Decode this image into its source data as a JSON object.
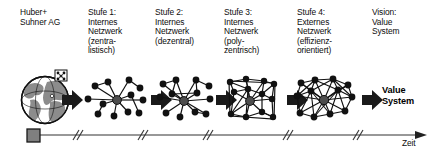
{
  "diagram": {
    "title_columns": [
      {
        "id": "company",
        "label": "Huber+\nSuhner AG",
        "x": 20,
        "y": 8
      },
      {
        "id": "stage-1",
        "label": "Stufe 1:\nInternes\nNetzwerk\n(zentra-\nlistisch)",
        "x": 88,
        "y": 8
      },
      {
        "id": "stage-2",
        "label": "Stufe 2:\nInternes\nNetzwerk\n(dezentral)",
        "x": 155,
        "y": 8
      },
      {
        "id": "stage-3",
        "label": "Stufe 3:\nInternes\nNetzwerk\n(poly-\nzentrisch)",
        "x": 224,
        "y": 8
      },
      {
        "id": "stage-4",
        "label": "Stufe 4:\nExternes\nNetzwerk\n(effizienz-\norientiert)",
        "x": 297,
        "y": 8
      },
      {
        "id": "vision",
        "label": "Vision:\nValue\nSystem",
        "x": 372,
        "y": 8
      }
    ],
    "result_label": {
      "text": "Value\nSystem",
      "x": 382,
      "y": 85
    },
    "axis": {
      "label": "Zeit",
      "label_x": 402,
      "label_y": 139,
      "line_y": 135,
      "line_start_x": 30,
      "line_end_x": 428,
      "break_marks_x": [
        75,
        140,
        205,
        285,
        355
      ]
    },
    "icon_names": {
      "globe": "globe-icon",
      "start_marker": "timeline-start-square-icon",
      "arrow": "block-arrow-icon",
      "network": "network-graph-icon",
      "axis_arrow": "axis-arrowhead-icon",
      "break": "axis-break-icon"
    },
    "colors": {
      "ink": "#0d0d0d",
      "node": "#111111",
      "hub": "#4d4d4d",
      "globe_land": "#8c8c8c",
      "arrow": "#1a1a1a",
      "axis": "#333333",
      "marker": "#808080",
      "background": "#ffffff"
    },
    "stages": [
      {
        "id": "stage-1-network",
        "kind": "star-tree",
        "caption_ref": "stage-1",
        "cx": 117,
        "cy": 100,
        "hub": [
          117,
          100
        ],
        "nodes": [
          [
            95,
            86
          ],
          [
            108,
            82
          ],
          [
            129,
            80
          ],
          [
            140,
            88
          ],
          [
            88,
            99
          ],
          [
            103,
            104
          ],
          [
            131,
            95
          ],
          [
            143,
            100
          ],
          [
            98,
            114
          ],
          [
            114,
            116
          ],
          [
            128,
            112
          ],
          [
            139,
            113
          ]
        ],
        "edges": [
          [
            0,
            1
          ],
          [
            1,
            2
          ],
          [
            2,
            3
          ],
          [
            4,
            5
          ],
          [
            6,
            7
          ],
          [
            8,
            9
          ],
          [
            10,
            11
          ]
        ],
        "hub_links": [
          0,
          1,
          2,
          4,
          5,
          6,
          7,
          9,
          10
        ]
      },
      {
        "id": "stage-2-network",
        "kind": "decentral-star",
        "caption_ref": "stage-2",
        "cx": 186,
        "cy": 100,
        "hub": [
          184,
          101
        ],
        "nodes": [
          [
            163,
            84
          ],
          [
            176,
            80
          ],
          [
            196,
            80
          ],
          [
            209,
            86
          ],
          [
            160,
            97
          ],
          [
            172,
            94
          ],
          [
            197,
            93
          ],
          [
            210,
            99
          ],
          [
            166,
            113
          ],
          [
            180,
            117
          ],
          [
            195,
            112
          ],
          [
            206,
            114
          ]
        ],
        "edges": [
          [
            0,
            1
          ],
          [
            2,
            3
          ],
          [
            5,
            6
          ],
          [
            8,
            9
          ],
          [
            10,
            11
          ],
          [
            1,
            5
          ],
          [
            2,
            6
          ]
        ],
        "hub_links": [
          0,
          1,
          2,
          4,
          5,
          6,
          7,
          8,
          9,
          10,
          11
        ]
      },
      {
        "id": "stage-3-network",
        "kind": "polycentric-mesh",
        "caption_ref": "stage-3",
        "cx": 252,
        "cy": 100,
        "hub": [
          250,
          101
        ],
        "frame": [
          228,
          80,
          48,
          42
        ],
        "nodes": [
          [
            230,
            82
          ],
          [
            246,
            79
          ],
          [
            264,
            81
          ],
          [
            274,
            84
          ],
          [
            234,
            92
          ],
          [
            248,
            89
          ],
          [
            262,
            94
          ],
          [
            272,
            99
          ],
          [
            231,
            114
          ],
          [
            246,
            117
          ],
          [
            262,
            112
          ],
          [
            273,
            117
          ]
        ],
        "edges": [
          [
            0,
            1
          ],
          [
            1,
            2
          ],
          [
            2,
            3
          ],
          [
            0,
            4
          ],
          [
            4,
            5
          ],
          [
            5,
            6
          ],
          [
            6,
            7
          ],
          [
            4,
            8
          ],
          [
            8,
            9
          ],
          [
            9,
            10
          ],
          [
            10,
            11
          ],
          [
            3,
            7
          ],
          [
            7,
            11
          ],
          [
            1,
            5
          ],
          [
            2,
            6
          ],
          [
            5,
            9
          ],
          [
            6,
            10
          ],
          [
            0,
            5
          ],
          [
            3,
            6
          ],
          [
            8,
            5
          ],
          [
            11,
            10
          ]
        ],
        "hub_links": [
          1,
          4,
          5,
          6,
          7,
          9,
          10,
          8,
          2
        ]
      },
      {
        "id": "stage-4-network",
        "kind": "dense-external-mesh",
        "caption_ref": "stage-4",
        "cx": 325,
        "cy": 100,
        "hub": [
          324,
          100
        ],
        "nodes": [
          [
            301,
            83
          ],
          [
            315,
            80
          ],
          [
            333,
            79
          ],
          [
            348,
            85
          ],
          [
            297,
            96
          ],
          [
            311,
            91
          ],
          [
            338,
            90
          ],
          [
            352,
            97
          ],
          [
            300,
            113
          ],
          [
            314,
            117
          ],
          [
            330,
            114
          ],
          [
            345,
            111
          ]
        ],
        "edges": [
          [
            0,
            1
          ],
          [
            1,
            2
          ],
          [
            2,
            3
          ],
          [
            0,
            4
          ],
          [
            4,
            5
          ],
          [
            5,
            1
          ],
          [
            2,
            6
          ],
          [
            6,
            3
          ],
          [
            6,
            7
          ],
          [
            7,
            11
          ],
          [
            4,
            8
          ],
          [
            8,
            9
          ],
          [
            9,
            10
          ],
          [
            10,
            11
          ],
          [
            5,
            9
          ],
          [
            6,
            10
          ],
          [
            1,
            6
          ],
          [
            2,
            5
          ],
          [
            0,
            5
          ],
          [
            3,
            7
          ],
          [
            8,
            5
          ],
          [
            9,
            6
          ],
          [
            11,
            6
          ],
          [
            10,
            5
          ],
          [
            2,
            7
          ],
          [
            1,
            4
          ]
        ],
        "hub_links": [
          0,
          1,
          2,
          3,
          4,
          5,
          6,
          7,
          8,
          9,
          10,
          11
        ]
      }
    ],
    "arrows": [
      {
        "id": "arrow-1",
        "x": 62,
        "y": 100
      },
      {
        "id": "arrow-2",
        "x": 151,
        "y": 100
      },
      {
        "id": "arrow-3",
        "x": 216,
        "y": 100
      },
      {
        "id": "arrow-4",
        "x": 287,
        "y": 100
      },
      {
        "id": "arrow-5",
        "x": 362,
        "y": 100
      }
    ],
    "globe": {
      "cx": 45,
      "cy": 100,
      "r": 24,
      "badge_x": 57,
      "badge_y": 72
    },
    "start_marker": {
      "x": 27,
      "y": 128,
      "size": 12
    }
  }
}
